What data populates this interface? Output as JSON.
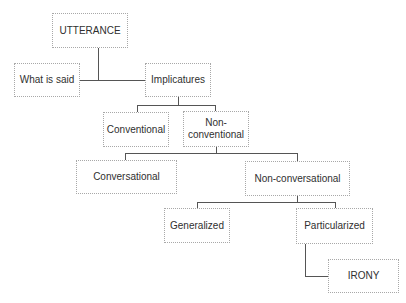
{
  "diagram": {
    "type": "tree",
    "nodes": {
      "utterance": "UTTERANCE",
      "what_is_said": "What is said",
      "implicatures": "Implicatures",
      "conventional": "Conventional",
      "non_conventional": "Non-\nconventional",
      "conversational": "Conversational",
      "non_conversational": "Non-conversational",
      "generalized": "Generalized",
      "particularized": "Particularized",
      "irony": "IRONY"
    },
    "edges": [
      [
        "UTTERANCE",
        "What is said"
      ],
      [
        "UTTERANCE",
        "Implicatures"
      ],
      [
        "Implicatures",
        "Conventional"
      ],
      [
        "Implicatures",
        "Non-conventional"
      ],
      [
        "Non-conventional",
        "Conversational"
      ],
      [
        "Non-conventional",
        "Non-conversational"
      ],
      [
        "Non-conversational",
        "Generalized"
      ],
      [
        "Non-conversational",
        "Particularized"
      ],
      [
        "Particularized",
        "IRONY"
      ]
    ]
  }
}
